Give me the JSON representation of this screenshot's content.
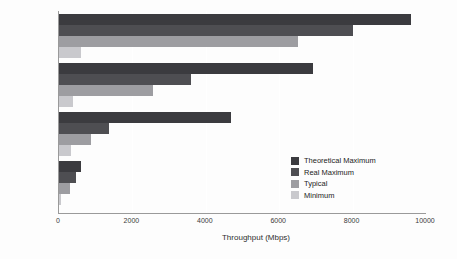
{
  "chart_data": {
    "type": "bar",
    "orientation": "horizontal",
    "title": "",
    "xlabel": "Throughput (Mbps)",
    "ylabel": "",
    "xlim": [
      0,
      10000
    ],
    "xticks": [
      "0",
      "2000",
      "4000",
      "6000",
      "8000",
      "10000"
    ],
    "grid": "vertical-white-gridlines",
    "legend_position": "inner-right",
    "categories": [
      "802.11ax",
      "802.11ac\n(Wave 2)",
      "802.11ac\n(Wave 1)",
      "802.11n"
    ],
    "series": [
      {
        "name": "Theoretical Maximum",
        "color": "#3b3b3f",
        "values": [
          9600,
          6930,
          4700,
          600
        ]
      },
      {
        "name": "Real Maximum",
        "color": "#4e4e52",
        "values": [
          8000,
          3600,
          1350,
          450
        ]
      },
      {
        "name": "Typical",
        "color": "#9d9da1",
        "values": [
          6500,
          2560,
          870,
          300
        ]
      },
      {
        "name": "Minimum",
        "color": "#c9c9cd",
        "values": [
          600,
          380,
          320,
          50
        ]
      }
    ]
  }
}
